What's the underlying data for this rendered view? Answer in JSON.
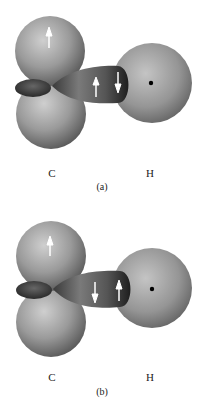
{
  "figure": {
    "panels": [
      {
        "id": "a",
        "caption": "(a)",
        "atoms": {
          "left": "C",
          "right": "H"
        },
        "spins": {
          "carbon_p_orbital": "up",
          "bond_electron_carbon_side": "up",
          "bond_electron_hydrogen_side": "down"
        }
      },
      {
        "id": "b",
        "caption": "(b)",
        "atoms": {
          "left": "C",
          "right": "H"
        },
        "spins": {
          "carbon_p_orbital": "up",
          "bond_electron_carbon_side": "down",
          "bond_electron_hydrogen_side": "up"
        }
      }
    ],
    "colors": {
      "sphere_light": "#c8c8c8",
      "sphere_dark": "#5a5a5a",
      "lobe_dark": "#2e2e2e",
      "arrow": "#ffffff",
      "nucleus": "#000000"
    }
  }
}
